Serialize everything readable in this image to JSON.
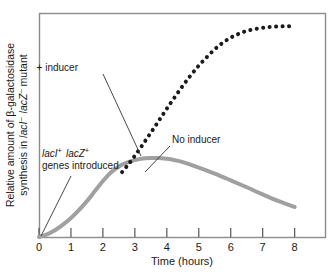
{
  "chart_data": {
    "type": "line",
    "title": "",
    "xlabel": "Time (hours)",
    "ylabel_line1": "Relative amount of β-galactosidase",
    "ylabel_line2_prefix": "synthesis in ",
    "ylabel_line2_italic1": "lacI",
    "ylabel_line2_sup1": "–",
    "ylabel_line2_italic2": "lacZ",
    "ylabel_line2_sup2": "–",
    "ylabel_line2_suffix": " mutant",
    "ylabel_full": "Relative amount of β-galactosidase synthesis in lacI– lacZ– mutant",
    "xticks": [
      0,
      1,
      2,
      3,
      4,
      5,
      6,
      7,
      8
    ],
    "xtick_labels": [
      "0",
      "1",
      "2",
      "3",
      "4",
      "5",
      "6",
      "7",
      "8"
    ],
    "yticks": [],
    "ytick_labels": [],
    "xlim": [
      0,
      8.95
    ],
    "ylim": [
      0,
      1.0
    ],
    "grid": false,
    "legend": "none",
    "series": [
      {
        "name": "No inducer",
        "style": "solid",
        "color": "#a0a0a0",
        "width": 4,
        "x": [
          0,
          0.25,
          0.5,
          0.75,
          1.0,
          1.25,
          1.5,
          1.75,
          2.0,
          2.25,
          2.5,
          2.75,
          3.0,
          3.25,
          3.5,
          3.7,
          4.0,
          4.25,
          4.5,
          5.0,
          5.5,
          6.0,
          6.5,
          7.0,
          7.5,
          8.0
        ],
        "y": [
          0.0,
          0.012,
          0.03,
          0.055,
          0.085,
          0.12,
          0.16,
          0.205,
          0.25,
          0.288,
          0.315,
          0.332,
          0.343,
          0.35,
          0.3525,
          0.353,
          0.349,
          0.343,
          0.334,
          0.31,
          0.283,
          0.253,
          0.222,
          0.19,
          0.16,
          0.134
        ]
      },
      {
        "name": "+ inducer",
        "style": "dotted",
        "color": "#1a1a1a",
        "width": 4,
        "x": [
          2.6,
          2.8,
          3.0,
          3.2,
          3.4,
          3.6,
          3.8,
          4.0,
          4.25,
          4.5,
          4.75,
          5.0,
          5.25,
          5.5,
          5.75,
          6.0,
          6.25,
          6.5,
          6.75,
          7.0,
          7.25,
          7.5,
          7.75,
          8.0
        ],
        "y": [
          0.29,
          0.325,
          0.363,
          0.403,
          0.445,
          0.487,
          0.53,
          0.573,
          0.625,
          0.675,
          0.722,
          0.765,
          0.803,
          0.838,
          0.867,
          0.89,
          0.907,
          0.92,
          0.928,
          0.934,
          0.938,
          0.94,
          0.9405,
          0.941
        ]
      }
    ],
    "annotations": [
      {
        "id": "plus-inducer",
        "text": "+ inducer",
        "text_x": 78,
        "text_y": 71,
        "leader_x1": 103,
        "leader_y1": 74,
        "leader_x2": 141,
        "leader_y2": 156
      },
      {
        "id": "no-inducer",
        "text": "No inducer",
        "text_x": 172,
        "text_y": 143,
        "leader_x1": 170,
        "leader_y1": 146,
        "leader_x2": 145,
        "leader_y2": 172
      },
      {
        "id": "genes-introduced",
        "line1_italic1": "lacI",
        "line1_sup1": "+",
        "line1_italic2": "lacZ",
        "line1_sup2": "+",
        "line2": "genes introduced",
        "text_full": "lacI+ lacZ+ genes introduced",
        "text_x": 42,
        "text_y": 157,
        "leader_x1": 71,
        "leader_y1": 176,
        "leader_x2": 41,
        "leader_y2": 236
      }
    ],
    "frame": {
      "left": 39,
      "top": 13,
      "right": 325,
      "bottom": 237,
      "color": "#8c8c8c"
    }
  }
}
